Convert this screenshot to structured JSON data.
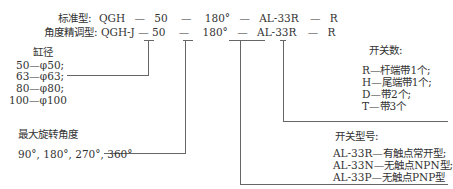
{
  "header": {
    "standard_label": "标准型: QGH — 50 — 180° — AL-33R — R",
    "precision_label": "角度精调型: QGH-J — 50 — 180° — AL-33R — R",
    "standard": {
      "prefix": "标准型:",
      "model": "QGH",
      "bore": "50",
      "angle": "180°",
      "switch": "AL-33R",
      "count": "R"
    },
    "precision": {
      "prefix": "角度精调型:",
      "model": "QGH-J",
      "bore": "50",
      "angle": "180°",
      "switch": "AL-33R",
      "count": "R"
    }
  },
  "bore": {
    "title": "缸径",
    "items": [
      "50—φ50;",
      "63—φ63;",
      "80—φ80;",
      "100—φ100"
    ]
  },
  "angle": {
    "title": "最大旋转角度",
    "values": "90°, 180°, 270°, 360°"
  },
  "switch_count": {
    "title": "开关数:",
    "items": [
      "R—杆端带1个;",
      "H—尾端带1个;",
      "D—带2个;",
      "T—带3个"
    ]
  },
  "switch_type": {
    "title": "开关型号:",
    "items": [
      "AL-33R—有触点常开型;",
      "AL-33N—无触点NPN型;",
      "AL-33P—无触点PNP型"
    ]
  }
}
